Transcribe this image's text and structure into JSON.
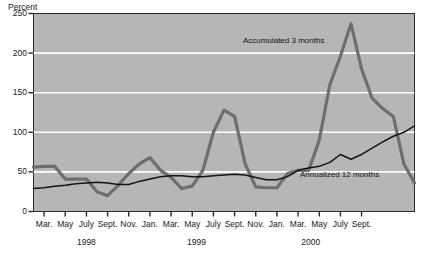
{
  "chart_data": {
    "type": "line",
    "title": "",
    "ylabel": "Percent",
    "xlabel": "",
    "ylim": [
      0,
      250
    ],
    "yticks": [
      0,
      50,
      100,
      150,
      200,
      250
    ],
    "gridlines": [
      50,
      100,
      150,
      200
    ],
    "grid": true,
    "legend_position": "inline-annotation",
    "xtick_labels": [
      "Mar.",
      "May",
      "July",
      "Sept.",
      "Nov.",
      "Jan.",
      "Mar.",
      "May",
      "July",
      "Sept.",
      "Nov.",
      "Jan.",
      "Mar.",
      "May",
      "July",
      "Sept."
    ],
    "year_groups": [
      {
        "label": "1998",
        "center_index": 2
      },
      {
        "label": "1999",
        "center_index": 7.2
      },
      {
        "label": "2000",
        "center_index": 12.6
      }
    ],
    "series": [
      {
        "name": "Accumulated 3 months",
        "color": "#6e6e6e",
        "width": 3.2,
        "values": [
          56,
          57,
          57,
          41,
          41,
          41,
          25,
          20,
          33,
          48,
          60,
          68,
          52,
          43,
          29,
          32,
          52,
          100,
          128,
          120,
          60,
          31,
          30,
          30,
          48,
          52,
          52,
          90,
          160,
          196,
          237,
          180,
          143,
          130,
          120,
          60,
          36
        ]
      },
      {
        "name": "Annualized 12 months",
        "color": "#141414",
        "width": 1.5,
        "values": [
          29,
          30,
          32,
          33,
          35,
          36,
          37,
          36,
          34,
          34,
          38,
          41,
          44,
          45,
          45,
          44,
          44,
          45,
          46,
          47,
          46,
          43,
          40,
          40,
          44,
          52,
          55,
          57,
          62,
          72,
          66,
          72,
          80,
          88,
          95,
          100,
          108
        ]
      }
    ],
    "annotations": [
      {
        "text": "Accumulated 3 months",
        "x_px": 243,
        "y_px": 36
      },
      {
        "text": "Annualized 12 months",
        "x_px": 300,
        "y_px": 170
      }
    ]
  }
}
